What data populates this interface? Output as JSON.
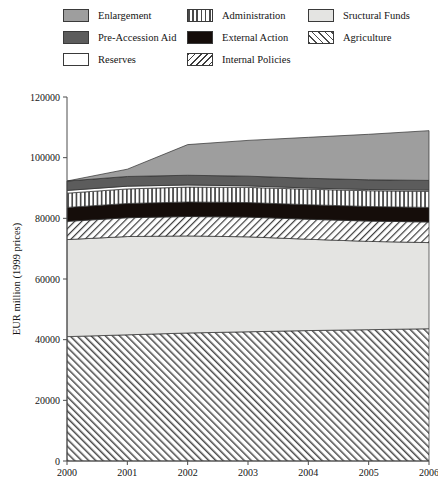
{
  "legend": {
    "items": [
      {
        "label": "Enlargement",
        "swatch": "enlargement",
        "color": "#9e9e9e",
        "col": 0,
        "row": 0
      },
      {
        "label": "Pre-Accession Aid",
        "swatch": "preaccession",
        "color": "#5c5c5c",
        "col": 0,
        "row": 1
      },
      {
        "label": "Reserves",
        "swatch": "reserves",
        "color": "#ffffff",
        "col": 0,
        "row": 2
      },
      {
        "label": "Administration",
        "swatch": "administration",
        "color": "#4a4a4a",
        "col": 1,
        "row": 0
      },
      {
        "label": "External Action",
        "swatch": "external",
        "color": "#150d0a",
        "col": 1,
        "row": 1
      },
      {
        "label": "Internal Policies",
        "swatch": "internal",
        "color": "#3d3d3d",
        "col": 1,
        "row": 2
      },
      {
        "label": "Sructural Funds",
        "swatch": "structural",
        "color": "#e4e4e2",
        "col": 2,
        "row": 0
      },
      {
        "label": "Agriculture",
        "swatch": "agriculture",
        "color": "#4a4a4a",
        "col": 2,
        "row": 1
      }
    ]
  },
  "chart_data": {
    "type": "area",
    "title": "",
    "xlabel": "",
    "ylabel": "EUR million (1999 prices)",
    "x": [
      2000,
      2001,
      2002,
      2003,
      2004,
      2005,
      2006
    ],
    "xlim": [
      2000,
      2006
    ],
    "ylim": [
      0,
      120000
    ],
    "yticks": [
      0,
      20000,
      40000,
      60000,
      80000,
      100000,
      120000
    ],
    "ytick_labels": [
      "0",
      "20000",
      "40000",
      "60000",
      "80000",
      "100000",
      "120000"
    ],
    "xtick_labels": [
      "2000",
      "2001",
      "2002",
      "2003",
      "2004",
      "2005",
      "2006"
    ],
    "grid": false,
    "stacked": true,
    "legend_position": "top",
    "stack_order_bottom_to_top": [
      "Agriculture",
      "Sructural Funds",
      "Internal Policies",
      "External Action",
      "Administration",
      "Reserves",
      "Pre-Accession Aid",
      "Enlargement"
    ],
    "series": [
      {
        "name": "Agriculture",
        "values": [
          41000,
          41600,
          42200,
          42600,
          43000,
          43300,
          43600
        ]
      },
      {
        "name": "Sructural Funds",
        "values": [
          32000,
          32400,
          32000,
          31300,
          30100,
          29100,
          28400
        ]
      },
      {
        "name": "Internal Policies",
        "values": [
          6000,
          6200,
          6400,
          6500,
          6600,
          6700,
          6800
        ]
      },
      {
        "name": "External Action",
        "values": [
          4600,
          4700,
          4800,
          4800,
          4800,
          4800,
          4800
        ]
      },
      {
        "name": "Administration",
        "values": [
          4700,
          4800,
          4900,
          5000,
          5100,
          5200,
          5300
        ]
      },
      {
        "name": "Reserves",
        "values": [
          900,
          900,
          700,
          500,
          400,
          400,
          400
        ]
      },
      {
        "name": "Pre-Accession Aid",
        "values": [
          3100,
          3200,
          3200,
          3200,
          3200,
          3200,
          3200
        ]
      },
      {
        "name": "Enlargement",
        "values": [
          0,
          2400,
          10100,
          11800,
          13500,
          15000,
          16400
        ]
      }
    ],
    "totals": [
      92300,
      96200,
      104300,
      105700,
      106700,
      107700,
      108900
    ]
  },
  "axis": {
    "y_title": "EUR million (1999 prices)"
  },
  "header": {
    "running_note": ""
  }
}
